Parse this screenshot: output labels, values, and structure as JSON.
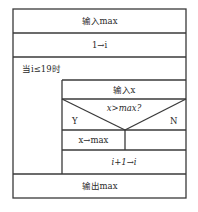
{
  "diagram": {
    "type": "N-S structured flowchart",
    "blocks": {
      "input_max": "输入max",
      "init_i": "1→i",
      "loop_condition": "当i≤19时",
      "input_x": "输入x",
      "decision": "x>max?",
      "branch_yes": "Y",
      "branch_no": "N",
      "assign_max": "x→max",
      "increment": "i+1→i",
      "output_max": "输出max"
    },
    "caption": ""
  }
}
